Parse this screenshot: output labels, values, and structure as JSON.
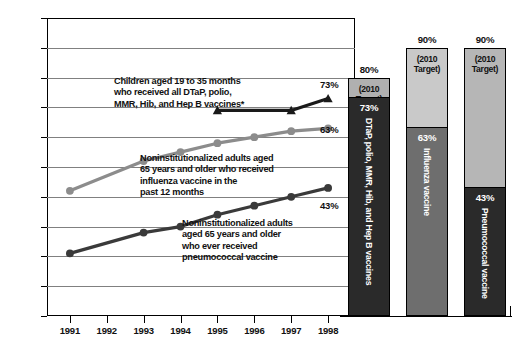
{
  "chart_data": {
    "type": "line",
    "title": "",
    "xlabel": "",
    "ylabel": "",
    "ylim": [
      0,
      100
    ],
    "ytick_labels": [
      "0%",
      "10%",
      "20%",
      "30%",
      "40%",
      "50%",
      "60%",
      "70%",
      "80%",
      "90%",
      "100%"
    ],
    "ytick_values": [
      0,
      10,
      20,
      30,
      40,
      50,
      60,
      70,
      80,
      90,
      100
    ],
    "categories": [
      "1991",
      "1992",
      "1993",
      "1994",
      "1995",
      "1996",
      "1997",
      "1998"
    ],
    "grid": true,
    "legend": "annotations-inline",
    "series": [
      {
        "name": "Children aged 19 to 35 months who received all DTaP, polio, MMR, Hib, and Hep B vaccines*",
        "marker": "triangle",
        "color": "#1a1a1a",
        "x": [
          "1995",
          "1997",
          "1998"
        ],
        "values": [
          69,
          69,
          73
        ],
        "end_label": "73%"
      },
      {
        "name": "Noninstitutionalized adults aged 65 years and older who received influenza vaccine in the past 12 months",
        "marker": "circle",
        "color": "#8c8c8c",
        "x": [
          "1991",
          "1993",
          "1994",
          "1995",
          "1996",
          "1997",
          "1998"
        ],
        "values": [
          42,
          52,
          55,
          58,
          60,
          62,
          63
        ],
        "end_label": "63%"
      },
      {
        "name": "Noninstitutionalized adults aged 65 years and older who ever received pneumococcal vaccine",
        "marker": "circle",
        "color": "#3a3a3a",
        "x": [
          "1991",
          "1993",
          "1994",
          "1995",
          "1996",
          "1997",
          "1998"
        ],
        "values": [
          21,
          28,
          30,
          34,
          37,
          40,
          43
        ],
        "end_label": "43%"
      }
    ],
    "annotations": [
      {
        "id": "dtap-note",
        "lines": [
          "Children aged 19 to 35 months",
          "who received all DTaP, polio,",
          "MMR, Hib, and Hep B vaccines*"
        ]
      },
      {
        "id": "influenza-note",
        "lines": [
          "Noninstitutionalized adults aged",
          "65 years and older who received",
          "influenza vaccine in the",
          "past 12 months"
        ]
      },
      {
        "id": "pneumococcal-note",
        "lines": [
          "Noninstitutionalized adults",
          "aged 65 years and older",
          "who ever received",
          "pneumococcal vaccine"
        ]
      }
    ],
    "bars": {
      "type": "bar",
      "target_caption": [
        "(2010",
        "Target)"
      ],
      "items": [
        {
          "id": "dtap",
          "label": "DTaP, polio, MMR, Hib, and Hep B vaccines",
          "target_label": "80%",
          "target": 80,
          "current_label": "73%",
          "current": 73,
          "upper_color": "#b0b0b0",
          "lower_color": "#2a2a2a",
          "target_text_color": "#111111"
        },
        {
          "id": "influenza",
          "label": "Influenza vaccine",
          "target_label": "90%",
          "target": 90,
          "current_label": "63%",
          "current": 63,
          "upper_color": "#c9c9c9",
          "lower_color": "#6e6e6e",
          "target_text_color": "#111111"
        },
        {
          "id": "pneumococcal",
          "label": "Pneumococcal vaccine",
          "target_label": "90%",
          "target": 90,
          "current_label": "43%",
          "current": 43,
          "upper_color": "#b6b6b6",
          "lower_color": "#2a2a2a",
          "target_text_color": "#111111"
        }
      ]
    }
  }
}
